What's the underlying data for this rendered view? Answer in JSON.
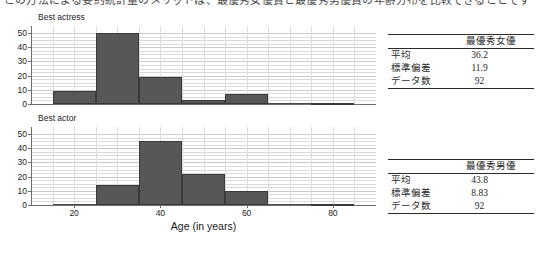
{
  "top_caption": "この方法による要約統計量のメリットは、最優秀女優賞と最優秀男優賞の年齢分布を比較できることです",
  "axis": {
    "xlabel": "Age (in years)",
    "xticks": [
      20,
      40,
      60,
      80
    ],
    "yticks": [
      0,
      10,
      20,
      30,
      40,
      50
    ],
    "ylim": [
      0,
      55
    ],
    "xlim": [
      10,
      90
    ]
  },
  "charts": [
    {
      "title": "Best actress",
      "stat_header": "最優秀女優",
      "stats": [
        {
          "label": "平均",
          "value": "36.2"
        },
        {
          "label": "標準偏差",
          "value": "11.9"
        },
        {
          "label": "データ数",
          "value": "92"
        }
      ]
    },
    {
      "title": "Best actor",
      "stat_header": "最優秀男優",
      "stats": [
        {
          "label": "平均",
          "value": "43.8"
        },
        {
          "label": "標準偏差",
          "value": "8.83"
        },
        {
          "label": "データ数",
          "value": "92"
        }
      ]
    }
  ],
  "chart_data": [
    {
      "type": "bar",
      "title": "Best actress",
      "xlabel": "Age (in years)",
      "ylabel": "",
      "xlim": [
        10,
        90
      ],
      "ylim": [
        0,
        55
      ],
      "grid": true,
      "legend": "none",
      "bin_width": 10,
      "bin_edges": [
        15,
        25,
        35,
        45,
        55,
        65,
        75,
        85
      ],
      "categories": [
        "15-25",
        "25-35",
        "35-45",
        "45-55",
        "55-65",
        "65-75",
        "75-85"
      ],
      "values": [
        9,
        50,
        19,
        3,
        7,
        0,
        1
      ]
    },
    {
      "type": "bar",
      "title": "Best actor",
      "xlabel": "Age (in years)",
      "ylabel": "",
      "xlim": [
        10,
        90
      ],
      "ylim": [
        0,
        55
      ],
      "grid": true,
      "legend": "none",
      "bin_width": 10,
      "bin_edges": [
        15,
        25,
        35,
        45,
        55,
        65,
        75,
        85
      ],
      "categories": [
        "15-25",
        "25-35",
        "35-45",
        "45-55",
        "55-65",
        "65-75",
        "75-85"
      ],
      "values": [
        0,
        14,
        45,
        22,
        10,
        0,
        1
      ]
    }
  ]
}
